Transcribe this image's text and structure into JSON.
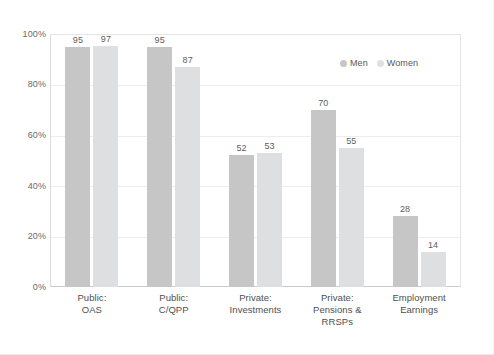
{
  "chart_data": {
    "type": "bar",
    "title": "",
    "subtitle": "",
    "xlabel": "",
    "ylabel": "",
    "ylim": [
      0,
      100
    ],
    "y_ticks": [
      "0%",
      "20%",
      "40%",
      "60%",
      "80%",
      "100%"
    ],
    "y_tick_values": [
      0,
      20,
      40,
      60,
      80,
      100
    ],
    "grid": true,
    "grid_axis": "y",
    "legend_position": "top-right inside plot area",
    "value_labels": true,
    "value_label_format": "integer (percent implied)",
    "categories": [
      {
        "line1": "Public:",
        "line2": "OAS"
      },
      {
        "line1": "Public:",
        "line2": "C/QPP"
      },
      {
        "line1": "Private:",
        "line2": "Investments"
      },
      {
        "line1": "Private:",
        "line2": "Pensions & RRSPs"
      },
      {
        "line1": "Employment",
        "line2": "Earnings"
      }
    ],
    "series": [
      {
        "name": "Men",
        "color": "#c6c6c6",
        "values": [
          95,
          95,
          52,
          70,
          28
        ]
      },
      {
        "name": "Women",
        "color": "#dedfe0",
        "values": [
          97,
          87,
          53,
          55,
          14
        ]
      }
    ]
  },
  "legend": {
    "items": [
      {
        "label": "Men",
        "color": "#c6c6c6"
      },
      {
        "label": "Women",
        "color": "#dedfe0"
      }
    ]
  },
  "colors": {
    "background": "#ffffff",
    "gridline": "#ededf0",
    "axis": "#c9cacd",
    "tick_text": "#6a6a6a",
    "category_text": "#4f4f4f",
    "value_text": "#5e5e5e",
    "series_men": "#c6c6c6",
    "series_women": "#dedfe0"
  }
}
